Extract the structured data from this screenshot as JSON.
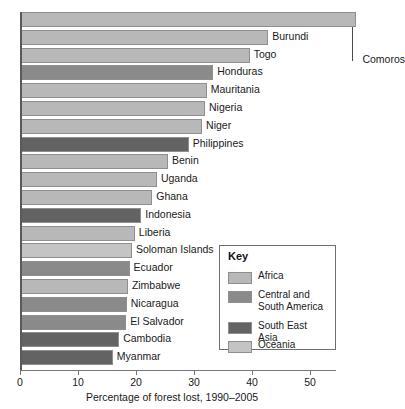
{
  "chart_data": {
    "type": "bar",
    "orientation": "horizontal",
    "title": "",
    "xlabel": "Percentage of forest lost, 1990–2005",
    "ylabel": "",
    "xlim": [
      0,
      58
    ],
    "xticks": [
      0,
      10,
      20,
      30,
      40,
      50
    ],
    "xtick_labels": [
      "0",
      "10",
      "20",
      "30",
      "40",
      "50"
    ],
    "grid": false,
    "legend_position": "inside-bottom-right",
    "categories": [
      "Comoros",
      "Burundi",
      "Togo",
      "Honduras",
      "Mauritania",
      "Nigeria",
      "Niger",
      "Philippines",
      "Benin",
      "Uganda",
      "Ghana",
      "Indonesia",
      "Liberia",
      "Soloman Islands",
      "Ecuador",
      "Zimbabwe",
      "Nicaragua",
      "El Salvador",
      "Cambodia",
      "Myanmar"
    ],
    "values": [
      58.0,
      42.8,
      39.6,
      33.3,
      32.2,
      31.9,
      31.4,
      29.1,
      25.5,
      23.6,
      22.8,
      20.9,
      19.8,
      19.3,
      18.9,
      18.6,
      18.4,
      18.3,
      17.1,
      16.0
    ],
    "groups": [
      "Africa",
      "Africa",
      "Africa",
      "Central and South America",
      "Africa",
      "Africa",
      "Africa",
      "South East Asia",
      "Africa",
      "Africa",
      "Africa",
      "South East Asia",
      "Africa",
      "Oceania",
      "Central and South America",
      "Africa",
      "Central and South America",
      "Central and South America",
      "South East Asia",
      "South East Asia"
    ],
    "series": [
      {
        "name": "Percentage of forest lost",
        "values": [
          58.0,
          42.8,
          39.6,
          33.3,
          32.2,
          31.9,
          31.4,
          29.1,
          25.5,
          23.6,
          22.8,
          20.9,
          19.8,
          19.3,
          18.9,
          18.6,
          18.4,
          18.3,
          17.1,
          16.0
        ]
      }
    ],
    "annotations": [
      {
        "text": "Comoros",
        "note": "label placed to the right of the plot with a vertical leader line up to the top bar"
      }
    ]
  },
  "legend": {
    "title": "Key",
    "items": [
      {
        "label": "Africa",
        "color": "#b8b8b8"
      },
      {
        "label": "Central and\nSouth America",
        "color": "#8a8a8a"
      },
      {
        "label": "South East Asia",
        "color": "#636363"
      },
      {
        "label": "Oceania",
        "color": "#c4c4c4"
      }
    ]
  },
  "colors": {
    "africa": "#b8b8b8",
    "central_and_south_america": "#8a8a8a",
    "south_east_asia": "#636363",
    "oceania": "#c4c4c4",
    "bar_outline": "#8f8f8f",
    "axis": "#767676",
    "text": "#1a1a1a",
    "background": "#ffffff"
  },
  "axis": {
    "x_label": "Percentage of forest lost, 1990–2005",
    "tick_labels": [
      "0",
      "10",
      "20",
      "30",
      "40",
      "50"
    ]
  }
}
